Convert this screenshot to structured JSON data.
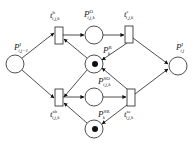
{
  "diagram": {
    "type": "petri-net",
    "places": [
      {
        "id": "p_in",
        "main": "P",
        "sup": "I",
        "sub": "i,j−1",
        "token": false
      },
      {
        "id": "p_o",
        "main": "P",
        "sup": "O",
        "sub": "i,j,k",
        "token": false
      },
      {
        "id": "p_r",
        "main": "P",
        "sup": "R",
        "sub": "k",
        "token": true
      },
      {
        "id": "p_so",
        "main": "P",
        "sup": "SO",
        "sub": "i,j,k",
        "token": false
      },
      {
        "id": "p_sr",
        "main": "P",
        "sup": "SR",
        "sub": "k",
        "token": true
      },
      {
        "id": "p_out",
        "main": "P",
        "sup": "I",
        "sub": "i,j",
        "token": false
      }
    ],
    "transitions": [
      {
        "id": "t_b",
        "main": "t",
        "sup": "b",
        "sub": "i,j,k"
      },
      {
        "id": "t_e",
        "main": "t",
        "sup": "e",
        "sub": "i,j,k"
      },
      {
        "id": "t_sb",
        "main": "t",
        "sup": "sb",
        "sub": "i,j,k"
      },
      {
        "id": "t_se",
        "main": "t",
        "sup": "se",
        "sub": "i,j,k"
      }
    ],
    "arcs": [
      [
        "p_in",
        "t_b"
      ],
      [
        "p_in",
        "t_sb"
      ],
      [
        "t_b",
        "p_o"
      ],
      [
        "p_o",
        "t_e"
      ],
      [
        "t_e",
        "p_out"
      ],
      [
        "t_e",
        "p_r"
      ],
      [
        "p_r",
        "t_b"
      ],
      [
        "p_r",
        "t_sb"
      ],
      [
        "t_sb",
        "p_so"
      ],
      [
        "p_so",
        "t_se"
      ],
      [
        "t_se",
        "p_out"
      ],
      [
        "t_se",
        "p_r"
      ],
      [
        "t_se",
        "p_sr"
      ],
      [
        "p_sr",
        "t_sb"
      ]
    ]
  }
}
